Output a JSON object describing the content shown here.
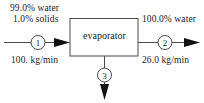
{
  "diagram": {
    "type": "process-flow-diagram",
    "unit": {
      "label": "evaporator",
      "shape": "rectangle"
    },
    "colors": {
      "line": "#4a4a4a",
      "arrow": "#111111",
      "text": "#1b1b1b",
      "background": "#ffffff"
    },
    "streams": [
      {
        "id": "1",
        "number": "1",
        "direction": "in",
        "side": "left",
        "composition_line_1": "99.0% water",
        "composition_line_2": "1.0% solids",
        "flow_rate": "100. kg/min"
      },
      {
        "id": "2",
        "number": "2",
        "direction": "out",
        "side": "right",
        "composition_line_1": "100.0% water",
        "flow_rate": "26.0 kg/min"
      },
      {
        "id": "3",
        "number": "3",
        "direction": "out",
        "side": "bottom"
      }
    ]
  }
}
